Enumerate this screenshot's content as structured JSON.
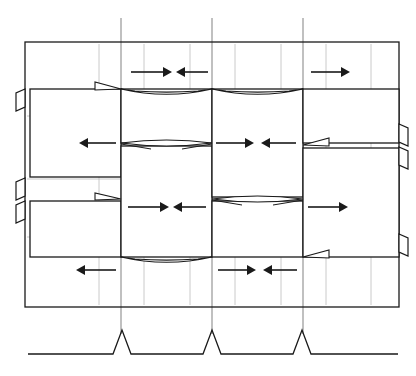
{
  "figure": {
    "type": "structural-deformation-diagram",
    "title": "",
    "caption": "",
    "background_color": "#ffffff",
    "stroke_color": "#1a1a1a",
    "grid_color": "#8c8c8c",
    "light_grid_color": "#bdbdbd",
    "width": 416,
    "height": 376
  },
  "frame": {
    "name": "outer-frame",
    "x": 25,
    "y": 42,
    "width": 374,
    "height": 265,
    "stroke_width": 1.3
  },
  "gridlines": {
    "vertical_major": [
      {
        "label": "A",
        "x": 121,
        "y1": 18,
        "y2": 334
      },
      {
        "label": "B",
        "x": 212,
        "y1": 18,
        "y2": 334
      },
      {
        "label": "C",
        "x": 303,
        "y1": 18,
        "y2": 334
      }
    ],
    "vertical_minor": [
      {
        "x": 99,
        "y1": 44,
        "y2": 305
      },
      {
        "x": 144,
        "y1": 44,
        "y2": 305
      },
      {
        "x": 190,
        "y1": 44,
        "y2": 305
      },
      {
        "x": 235,
        "y1": 44,
        "y2": 305
      },
      {
        "x": 281,
        "y1": 44,
        "y2": 305
      },
      {
        "x": 326,
        "y1": 44,
        "y2": 305
      },
      {
        "x": 371,
        "y1": 44,
        "y2": 305
      }
    ],
    "horizontal_minor": [
      {
        "y": 116,
        "x1": 27,
        "x2": 397
      },
      {
        "y": 179,
        "x1": 27,
        "x2": 397
      },
      {
        "y": 237,
        "x1": 27,
        "x2": 397
      }
    ],
    "horizontal_major": [
      {
        "y": 42,
        "x1": 25,
        "x2": 399
      },
      {
        "y": 307,
        "x1": 25,
        "x2": 399
      }
    ]
  },
  "blocks": [
    {
      "name": "block-left-upper",
      "x": 30,
      "y": 89,
      "width": 91,
      "height": 88,
      "bay": "left",
      "tier": "upper"
    },
    {
      "name": "block-left-lower",
      "x": 30,
      "y": 201,
      "width": 91,
      "height": 56,
      "bay": "left",
      "tier": "lower"
    },
    {
      "name": "block-mid1-upper",
      "x": 121,
      "y": 89,
      "width": 91,
      "height": 54,
      "bay": "mid-1",
      "tier": "upper"
    },
    {
      "name": "block-mid1-lower",
      "x": 121,
      "y": 146,
      "width": 91,
      "height": 111,
      "bay": "mid-1",
      "tier": "lower"
    },
    {
      "name": "block-mid2-upper",
      "x": 212,
      "y": 89,
      "width": 91,
      "height": 108,
      "bay": "mid-2",
      "tier": "upper"
    },
    {
      "name": "block-mid2-lower",
      "x": 212,
      "y": 201,
      "width": 91,
      "height": 56,
      "bay": "mid-2",
      "tier": "lower"
    },
    {
      "name": "block-right-upper",
      "x": 303,
      "y": 89,
      "width": 96,
      "height": 54,
      "bay": "right",
      "tier": "upper"
    },
    {
      "name": "block-right-lower",
      "x": 303,
      "y": 148,
      "width": 96,
      "height": 109,
      "bay": "right",
      "tier": "lower"
    }
  ],
  "hinges": [
    {
      "name": "hinge-mid1-mid",
      "x1": 121,
      "x2": 212,
      "y": 143,
      "style": "lens",
      "depth": 6
    },
    {
      "name": "hinge-mid2-mid",
      "x1": 212,
      "x2": 303,
      "y": 199,
      "style": "lens",
      "depth": 6
    },
    {
      "name": "hinge-mid1-top",
      "x1": 121,
      "x2": 212,
      "y": 89,
      "style": "wedge-down",
      "depth": 7
    },
    {
      "name": "hinge-mid1-bot",
      "x1": 121,
      "x2": 212,
      "y": 257,
      "style": "wedge-down",
      "depth": 7
    },
    {
      "name": "hinge-mid2-top",
      "x1": 212,
      "x2": 303,
      "y": 89,
      "style": "wedge-down",
      "depth": 7
    },
    {
      "name": "hinge-left-top",
      "x1": 30,
      "x2": 121,
      "y": 89,
      "style": "wedge-right",
      "depth": 7
    },
    {
      "name": "hinge-left-bot",
      "x1": 30,
      "x2": 121,
      "y": 199,
      "style": "wedge-right",
      "depth": 6
    },
    {
      "name": "hinge-right-mid",
      "x1": 303,
      "x2": 399,
      "y": 145,
      "style": "wedge-left",
      "depth": 7
    },
    {
      "name": "hinge-right-bot",
      "x1": 303,
      "x2": 399,
      "y": 257,
      "style": "wedge-left",
      "depth": 7
    }
  ],
  "connectors": [
    {
      "name": "connector-left-top",
      "x": 25,
      "y": 89,
      "height": 22,
      "side": "left"
    },
    {
      "name": "connector-left-middle",
      "x": 25,
      "y": 178,
      "height": 22,
      "side": "left"
    },
    {
      "name": "connector-left-bottom",
      "x": 25,
      "y": 201,
      "height": 22,
      "side": "left"
    },
    {
      "name": "connector-right-top",
      "x": 399,
      "y": 124,
      "height": 22,
      "side": "right"
    },
    {
      "name": "connector-right-middle",
      "x": 399,
      "y": 147,
      "height": 22,
      "side": "right"
    },
    {
      "name": "connector-right-bottom",
      "x": 399,
      "y": 234,
      "height": 22,
      "side": "right"
    }
  ],
  "arrows": [
    {
      "name": "arrow-row1-left",
      "row": 1,
      "y": 72,
      "x_tail": 131,
      "x_head": 172,
      "direction": "right"
    },
    {
      "name": "arrow-row1-right",
      "row": 1,
      "y": 72,
      "x_tail": 208,
      "x_head": 176,
      "direction": "left"
    },
    {
      "name": "arrow-row1-far",
      "row": 1,
      "y": 72,
      "x_tail": 311,
      "x_head": 350,
      "direction": "right"
    },
    {
      "name": "arrow-row2-left",
      "row": 2,
      "y": 143,
      "x_tail": 116,
      "x_head": 79,
      "direction": "left"
    },
    {
      "name": "arrow-row2-mid",
      "row": 2,
      "y": 143,
      "x_tail": 216,
      "x_head": 254,
      "direction": "right"
    },
    {
      "name": "arrow-row2-mid2",
      "row": 2,
      "y": 143,
      "x_tail": 296,
      "x_head": 261,
      "direction": "left"
    },
    {
      "name": "arrow-row3-left",
      "row": 3,
      "y": 207,
      "x_tail": 128,
      "x_head": 169,
      "direction": "right"
    },
    {
      "name": "arrow-row3-right",
      "row": 3,
      "y": 207,
      "x_tail": 206,
      "x_head": 173,
      "direction": "left"
    },
    {
      "name": "arrow-row3-far",
      "row": 3,
      "y": 207,
      "x_tail": 308,
      "x_head": 348,
      "direction": "right"
    },
    {
      "name": "arrow-row4-left",
      "row": 4,
      "y": 270,
      "x_tail": 116,
      "x_head": 76,
      "direction": "left"
    },
    {
      "name": "arrow-row4-mid",
      "row": 4,
      "y": 270,
      "x_tail": 218,
      "x_head": 256,
      "direction": "right"
    },
    {
      "name": "arrow-row4-mid2",
      "row": 4,
      "y": 270,
      "x_tail": 297,
      "x_head": 263,
      "direction": "left"
    }
  ],
  "base": {
    "name": "ground-baseline",
    "y": 354,
    "x_start": 28,
    "x_end": 398,
    "supports": [
      {
        "name": "support-peak-a",
        "x": 122,
        "peak_height": 24,
        "half_width": 9
      },
      {
        "name": "support-peak-b",
        "x": 212,
        "peak_height": 24,
        "half_width": 9
      },
      {
        "name": "support-peak-c",
        "x": 302,
        "peak_height": 24,
        "half_width": 9
      }
    ]
  }
}
